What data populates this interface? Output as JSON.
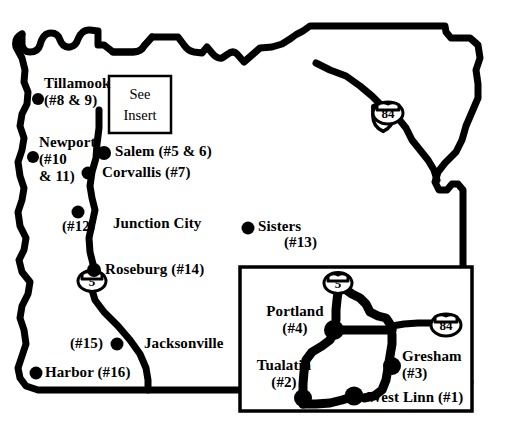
{
  "map": {
    "title": "Oregon study site map",
    "background_color": "#ffffff",
    "ink_color": "#000000",
    "insert_box": {
      "line1": "See",
      "line2": "Insert"
    },
    "main_labels": [
      {
        "id": "tillamook",
        "name": "Tillamook",
        "line1": "Tillamook",
        "line2": "(#8 & 9)",
        "site_numbers": "#8 & 9"
      },
      {
        "id": "newport",
        "name": "Newport",
        "line1": "Newport",
        "line2": "(#10",
        "line3": "& 11)",
        "site_numbers": "#10 & 11"
      },
      {
        "id": "salem",
        "name": "Salem",
        "line1": "Salem (#5 & 6)",
        "site_numbers": "#5 & 6"
      },
      {
        "id": "corvallis",
        "name": "Corvallis",
        "line1": "Corvallis (#7)",
        "site_numbers": "#7"
      },
      {
        "id": "site12",
        "name": "",
        "line1": "(#12)",
        "site_numbers": "#12"
      },
      {
        "id": "junction-city",
        "name": "Junction City",
        "line1": "Junction City",
        "site_numbers": ""
      },
      {
        "id": "sisters",
        "name": "Sisters",
        "line1": "Sisters",
        "line2": "(#13)",
        "site_numbers": "#13"
      },
      {
        "id": "roseburg",
        "name": "Roseburg",
        "line1": "Roseburg (#14)",
        "site_numbers": "#14"
      },
      {
        "id": "site15",
        "name": "",
        "line1": "(#15)",
        "site_numbers": "#15"
      },
      {
        "id": "jacksonville",
        "name": "Jacksonville",
        "line1": "Jacksonville",
        "site_numbers": ""
      },
      {
        "id": "harbor",
        "name": "Harbor",
        "line1": "Harbor (#16)",
        "site_numbers": "#16"
      }
    ],
    "inset_labels": [
      {
        "id": "portland",
        "name": "Portland",
        "line1": "Portland",
        "line2": "(#4)",
        "site_numbers": "#4"
      },
      {
        "id": "tualatin",
        "name": "Tualatin",
        "line1": "Tualatin",
        "line2": "(#2)",
        "site_numbers": "#2"
      },
      {
        "id": "gresham",
        "name": "Gresham",
        "line1": "Gresham",
        "line2": "(#3)",
        "site_numbers": "#3"
      },
      {
        "id": "west-linn",
        "name": "West Linn",
        "line1": "West Linn (#1)",
        "site_numbers": "#1"
      }
    ],
    "highway_shields": [
      {
        "id": "i84-main",
        "label": "84",
        "type": "interstate"
      },
      {
        "id": "i5-main",
        "label": "5",
        "type": "interstate"
      },
      {
        "id": "i5-inset",
        "label": "5",
        "type": "interstate"
      },
      {
        "id": "i84-inset",
        "label": "84",
        "type": "interstate"
      }
    ]
  }
}
